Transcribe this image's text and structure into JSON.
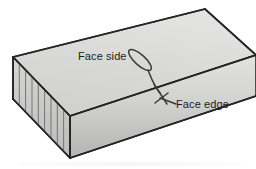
{
  "figure": {
    "name": "timber-board-face-side-face-edge",
    "background_color": "#ffffff",
    "width": 256,
    "height": 169
  },
  "annotations": {
    "face_side": {
      "label": "Face side",
      "pointer": "loop-leaf-marker",
      "target": "top-face"
    },
    "face_edge": {
      "label": "Face edge",
      "pointer": "cross-arrowhead",
      "target": "front-top-edge"
    }
  },
  "board": {
    "top_face_name": "face-side-surface",
    "front_face_name": "face-edge-surface",
    "end_face_name": "end-grain-surface",
    "end_grain_line_count": 8,
    "colors": {
      "top_face_light": "#dcdcda",
      "top_face_dark": "#cdcdcb",
      "front_face_light": "#e0e0de",
      "front_face_dark": "#b6b6b4",
      "end_face_light": "#d2d2d0",
      "end_face_dark": "#bdbdbb",
      "outline": "#2a2a2a",
      "hatch_line": "#6e6e6c",
      "leader_line": "#3a3a3a"
    }
  },
  "artifacts": {
    "bottom_smudge_color": "#f2f2f2"
  }
}
